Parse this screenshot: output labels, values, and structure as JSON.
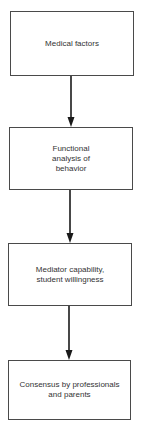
{
  "diagram": {
    "type": "vertical-flowchart",
    "nodes": [
      {
        "id": "n1",
        "label": "Medical factors"
      },
      {
        "id": "n2",
        "label": "Functional\nanalysis of\nbehavior"
      },
      {
        "id": "n3",
        "label": "Mediator capability,\nstudent willingness"
      },
      {
        "id": "n4",
        "label": "Consensus by professionals\nand parents"
      }
    ],
    "edges": [
      {
        "from": "n1",
        "to": "n2"
      },
      {
        "from": "n2",
        "to": "n3"
      },
      {
        "from": "n3",
        "to": "n4"
      }
    ],
    "colors": {
      "line": "#1a1a1a",
      "border": "#4a4a4a",
      "text": "#333333",
      "background": "#ffffff"
    }
  }
}
